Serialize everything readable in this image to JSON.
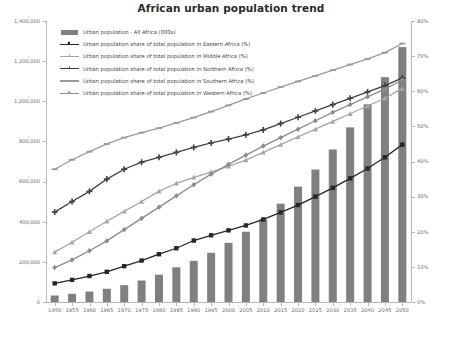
{
  "chart_data": {
    "type": "bar",
    "title": "African urban population trend",
    "xlabel": "",
    "ylabel": "",
    "y2label": "",
    "grid": false,
    "legend_position": "top-left",
    "categories": [
      "1950",
      "1955",
      "1960",
      "1965",
      "1970",
      "1975",
      "1980",
      "1985",
      "1990",
      "1995",
      "2000",
      "2005",
      "2010",
      "2015",
      "2020",
      "2025",
      "2030",
      "2035",
      "2040",
      "2045",
      "2050"
    ],
    "ylim": [
      0,
      1400000
    ],
    "y_ticks": [
      0,
      200000,
      400000,
      600000,
      800000,
      1000000,
      1200000,
      1400000
    ],
    "y_tick_labels": [
      "0",
      "200,000",
      "400,000",
      "600,000",
      "800,000",
      "1,000,000",
      "1,200,000",
      "1,400,000"
    ],
    "y2lim": [
      0,
      80
    ],
    "y2_ticks": [
      0,
      10,
      20,
      30,
      40,
      50,
      60,
      70,
      80
    ],
    "y2_tick_labels": [
      "0%",
      "10%",
      "20%",
      "30%",
      "40%",
      "50%",
      "60%",
      "70%",
      "80%"
    ],
    "series": [
      {
        "name": "Urban population - All Africa (000s)",
        "type": "bar",
        "axis": "left",
        "color": "#808080",
        "values": [
          32500,
          41000,
          52000,
          66000,
          84000,
          107000,
          136000,
          173000,
          205000,
          245000,
          295000,
          350000,
          412000,
          490000,
          575000,
          660000,
          760000,
          870000,
          985000,
          1120000,
          1270000
        ]
      },
      {
        "name": "Urban population share of total population in Eastern Africa (%)",
        "type": "line",
        "axis": "right",
        "color": "#262626",
        "marker": "square",
        "values": [
          5.3,
          6.3,
          7.4,
          8.6,
          10.2,
          11.8,
          13.6,
          15.3,
          17.5,
          19.0,
          20.4,
          21.8,
          23.5,
          25.5,
          27.6,
          30.0,
          32.5,
          35.2,
          38.0,
          41.2,
          44.8
        ]
      },
      {
        "name": "Urban population share of total population in Middle Africa (%)",
        "type": "line",
        "axis": "right",
        "color": "#a6a6a6",
        "marker": "triangle",
        "values": [
          14.2,
          17.0,
          20.0,
          23.0,
          25.8,
          28.6,
          31.5,
          33.8,
          35.5,
          37.0,
          38.6,
          40.4,
          42.6,
          44.8,
          47.0,
          49.2,
          51.4,
          53.6,
          55.8,
          58.0,
          60.8
        ]
      },
      {
        "name": "Urban population share of total population in Northern Africa (%)",
        "type": "line",
        "axis": "right",
        "color": "#404040",
        "marker": "cross",
        "values": [
          25.6,
          28.6,
          31.5,
          35.0,
          37.8,
          39.8,
          41.2,
          42.6,
          44.0,
          45.3,
          46.4,
          47.6,
          49.0,
          50.8,
          52.6,
          54.4,
          56.2,
          58.0,
          59.8,
          61.6,
          63.8
        ]
      },
      {
        "name": "Urban population share of total population in Southern Africa (%)",
        "type": "line",
        "axis": "right",
        "color": "#9a9a9a",
        "marker": "dash",
        "values": [
          37.8,
          40.5,
          42.8,
          45.0,
          46.8,
          48.2,
          49.5,
          51.0,
          52.5,
          54.2,
          56.0,
          57.8,
          59.5,
          61.2,
          62.8,
          64.4,
          66.0,
          67.6,
          69.2,
          71.0,
          73.6
        ]
      },
      {
        "name": "Urban population share of total population in Western Africa (%)",
        "type": "line",
        "axis": "right",
        "color": "#8c8c8c",
        "marker": "diamond",
        "values": [
          9.8,
          12.0,
          14.6,
          17.4,
          20.6,
          23.8,
          27.0,
          30.2,
          33.4,
          36.4,
          39.2,
          41.8,
          44.4,
          46.8,
          49.2,
          51.6,
          54.0,
          56.2,
          58.4,
          60.6,
          63.2
        ]
      }
    ]
  }
}
